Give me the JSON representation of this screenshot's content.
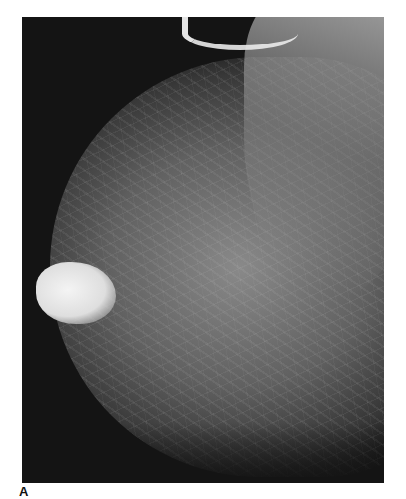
{
  "figure": {
    "panel_label": "A",
    "image_description": "Mammogram (mediolateral view) showing dense fibroglandular tissue with a bright, lobulated mass near the nipple region",
    "colors": {
      "background": "#ffffff",
      "frame": "#141414",
      "mass": "#f4f4f4"
    }
  }
}
